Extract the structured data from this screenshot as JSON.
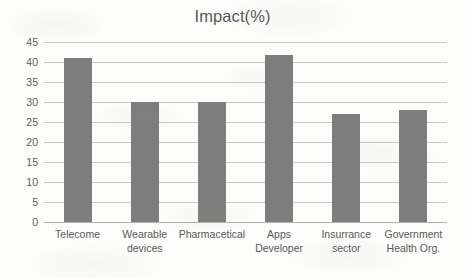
{
  "chart_data": {
    "type": "bar",
    "title": "Impact(%)",
    "xlabel": "",
    "ylabel": "",
    "categories": [
      "Telecome",
      "Wearable devices",
      "Pharmacetical",
      "Apps Developer",
      "Insurrance sector",
      "Government Health Org."
    ],
    "category_lines": [
      [
        "Telecome"
      ],
      [
        "Wearable",
        "devices"
      ],
      [
        "Pharmacetical"
      ],
      [
        "Apps",
        "Developer"
      ],
      [
        "Insurrance",
        "sector"
      ],
      [
        "Government",
        "Health Org."
      ]
    ],
    "values": [
      41,
      30,
      30,
      41.7,
      27,
      28
    ],
    "ylim": [
      0,
      45
    ],
    "ytick_values": [
      0,
      5,
      10,
      15,
      20,
      25,
      30,
      35,
      40,
      45
    ],
    "ytick_labels": [
      "0",
      "5",
      "10",
      "15",
      "20",
      "25",
      "30",
      "35",
      "40",
      "45"
    ],
    "grid": true,
    "legend": false,
    "series": [
      {
        "name": "Impact(%)",
        "values": [
          41,
          30,
          30,
          41.7,
          27,
          28
        ]
      }
    ],
    "colors": {
      "bar": "#7d7d7d",
      "gridline": "#c9c9c6",
      "axis": "#b0b0ad",
      "text": "#58585a",
      "background": "#fcfcfa"
    }
  }
}
